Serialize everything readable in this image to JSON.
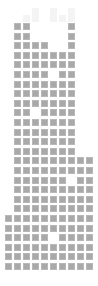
{
  "grid": {
    "columns": 10,
    "rows": 26,
    "origin_x": 5,
    "origin_y": 23,
    "pitch_x": 9,
    "pitch_y": 9.6,
    "cell_color": "#a9a9a9",
    "faint_color": "#f4f4f4",
    "faint_rows": [
      "..........",
      "...x.x.x..",
      "..xx.xxx.."
    ],
    "rows_map": [
      ".xx....x..",
      ".xx....x..",
      ".xxxx..x..",
      ".xxxxxxx..",
      ".xxxxxxx..",
      ".xxxx.xx..",
      ".xxxxxxx..",
      ".xxxxxxx..",
      ".xxxxxxx..",
      ".xx.xxxx..",
      ".xxxxxxx..",
      ".xxxxxxx..",
      ".xxxxxxx..",
      ".xxxxxxx..",
      ".xxxxxxxxx",
      ".xxxxxxxxx",
      ".xxxxxx.xx",
      ".xxxxxxxxx",
      ".xxxxxxxxx",
      ".xxxxxxxxx",
      "xxxxxxxxxx",
      "xxxxxxxxxx",
      "xxxxx.xxxx",
      "xxxxxxxxxx",
      "xxxxxxxxxx",
      "xxxxxxxxxx"
    ]
  }
}
